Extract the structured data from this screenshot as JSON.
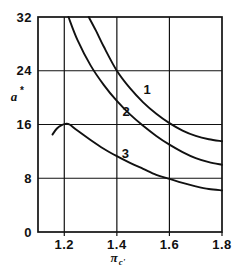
{
  "chart_data": {
    "type": "line",
    "title": "",
    "xlabel": "πc'",
    "ylabel": "a*",
    "xlim": [
      1.1,
      1.8
    ],
    "ylim": [
      0,
      32
    ],
    "grid": true,
    "legend": "inline-curve-labels",
    "x_ticks": [
      "1.2",
      "1.4",
      "1.6",
      "1.8"
    ],
    "x_tick_values": [
      1.2,
      1.4,
      1.6,
      1.8
    ],
    "y_ticks": [
      "0",
      "8",
      "16",
      "24",
      "32"
    ],
    "y_tick_values": [
      0,
      8,
      16,
      24,
      32
    ],
    "series": [
      {
        "name": "1",
        "label": "1",
        "label_x": 1.515,
        "label_y": 20.6,
        "points": [
          [
            1.293,
            32.0
          ],
          [
            1.32,
            30.0
          ],
          [
            1.35,
            27.6
          ],
          [
            1.4,
            24.0
          ],
          [
            1.45,
            21.4
          ],
          [
            1.5,
            19.3
          ],
          [
            1.55,
            17.6
          ],
          [
            1.6,
            16.2
          ],
          [
            1.65,
            15.1
          ],
          [
            1.7,
            14.3
          ],
          [
            1.75,
            13.8
          ],
          [
            1.8,
            13.5
          ]
        ]
      },
      {
        "name": "2",
        "label": "2",
        "label_x": 1.435,
        "label_y": 17.2,
        "points": [
          [
            1.216,
            32.0
          ],
          [
            1.25,
            28.6
          ],
          [
            1.3,
            24.8
          ],
          [
            1.35,
            21.9
          ],
          [
            1.4,
            19.5
          ],
          [
            1.45,
            17.5
          ],
          [
            1.5,
            15.8
          ],
          [
            1.55,
            14.3
          ],
          [
            1.6,
            13.0
          ],
          [
            1.65,
            11.9
          ],
          [
            1.7,
            11.0
          ],
          [
            1.75,
            10.4
          ],
          [
            1.8,
            10.0
          ]
        ]
      },
      {
        "name": "3",
        "label": "3",
        "label_x": 1.432,
        "label_y": 11.0,
        "points": [
          [
            1.155,
            14.5
          ],
          [
            1.172,
            15.4
          ],
          [
            1.19,
            15.9
          ],
          [
            1.205,
            16.1
          ],
          [
            1.22,
            16.0
          ],
          [
            1.25,
            15.1
          ],
          [
            1.3,
            13.7
          ],
          [
            1.35,
            12.4
          ],
          [
            1.4,
            11.3
          ],
          [
            1.45,
            10.3
          ],
          [
            1.5,
            9.4
          ],
          [
            1.55,
            8.5
          ],
          [
            1.6,
            7.9
          ],
          [
            1.65,
            7.3
          ],
          [
            1.7,
            6.8
          ],
          [
            1.75,
            6.4
          ],
          [
            1.8,
            6.2
          ]
        ]
      }
    ],
    "annotations": [
      {
        "text": "peak of curve 3 at (1.2, 16)",
        "x": 1.2,
        "y": 16.0
      },
      {
        "text": "curve 1 crosses gridline at (1.4, 24)",
        "x": 1.4,
        "y": 24.0
      },
      {
        "text": "curve 3 crosses gridline at (1.58, 8)",
        "x": 1.58,
        "y": 8.0
      }
    ],
    "colors": {
      "line": "#111111",
      "grid": "#111111",
      "background": "#ffffff"
    }
  }
}
